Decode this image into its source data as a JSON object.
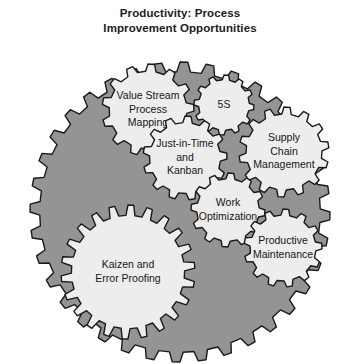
{
  "title": {
    "line1": "Productivity: Process",
    "line2": "Improvement Opportunities"
  },
  "colors": {
    "background": "#ffffff",
    "base_gear_fill": "#949494",
    "inner_gear_fill": "#ededed",
    "mid_gear_fill": "#a8a8a8",
    "outline": "#1a1a1a",
    "text": "#161616"
  },
  "diagram": {
    "type": "interlocking-gears",
    "base_gear": {
      "name": "base-gear",
      "cx": 180,
      "cy": 212,
      "radius": 150,
      "teeth": 36,
      "fill": "#949494"
    },
    "gears": [
      {
        "id": "value-stream-process-mapping",
        "label_lines": [
          "Value Stream",
          "Process",
          "Mapping"
        ],
        "cx": 148,
        "cy": 110,
        "radius": 46,
        "teeth": 13,
        "fill": "#ededed",
        "font_size": 10.5
      },
      {
        "id": "five-s",
        "label_lines": [
          "5S"
        ],
        "cx": 224,
        "cy": 105,
        "radius": 30,
        "teeth": 12,
        "fill": "#ededed",
        "font_size": 10.5
      },
      {
        "id": "just-in-time-and-kanban",
        "label_lines": [
          "Just-in-Time",
          "and",
          "Kanban"
        ],
        "cx": 185,
        "cy": 158,
        "radius": 42,
        "teeth": 13,
        "fill": "#ededed",
        "font_size": 10.5
      },
      {
        "id": "supply-chain-management",
        "label_lines": [
          "Supply",
          "Chain",
          "Management"
        ],
        "cx": 284,
        "cy": 152,
        "radius": 45,
        "teeth": 14,
        "fill": "#ededed",
        "font_size": 10.5
      },
      {
        "id": "work-optimization",
        "label_lines": [
          "Work",
          "Optimization"
        ],
        "cx": 228,
        "cy": 210,
        "radius": 37,
        "teeth": 12,
        "fill": "#ededed",
        "font_size": 10.5
      },
      {
        "id": "productive-maintenance",
        "label_lines": [
          "Productive",
          "Maintenance"
        ],
        "cx": 283,
        "cy": 248,
        "radius": 39,
        "teeth": 13,
        "fill": "#ededed",
        "font_size": 10.5
      },
      {
        "id": "kaizen-and-error-proofing",
        "label_lines": [
          "Kaizen and",
          "Error Proofing"
        ],
        "cx": 128,
        "cy": 272,
        "radius": 67,
        "teeth": 22,
        "fill": "#ededed",
        "font_size": 10.5
      }
    ]
  }
}
